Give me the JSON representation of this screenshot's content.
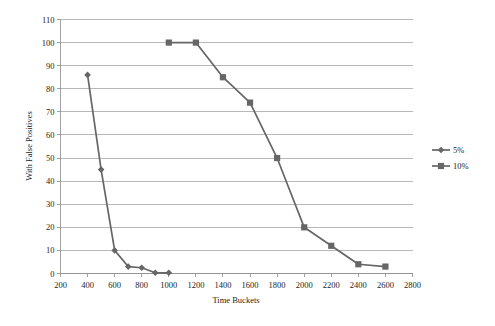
{
  "chart_data": {
    "type": "line",
    "title": "",
    "xlabel": "Time Buckets",
    "ylabel": "With False Positives",
    "xlim": [
      200,
      2800
    ],
    "ylim": [
      0,
      110
    ],
    "xticks": [
      200,
      400,
      600,
      800,
      1000,
      1200,
      1400,
      1600,
      1800,
      2000,
      2200,
      2400,
      2600,
      2800
    ],
    "yticks": [
      0,
      10,
      20,
      30,
      40,
      50,
      60,
      70,
      80,
      90,
      100,
      110
    ],
    "grid": "horizontal",
    "legend_position": "right",
    "series": [
      {
        "name": "5%",
        "marker": "diamond",
        "color": "#666666",
        "x": [
          400,
          500,
          600,
          700,
          800,
          900,
          1000
        ],
        "values": [
          86,
          45,
          10,
          3,
          2.5,
          0.3,
          0.3
        ]
      },
      {
        "name": "10%",
        "marker": "square",
        "color": "#666666",
        "x": [
          1000,
          1200,
          1400,
          1600,
          1800,
          2000,
          2200,
          2400,
          2600
        ],
        "values": [
          100,
          100,
          85,
          74,
          50,
          20,
          12,
          4,
          3
        ]
      }
    ]
  },
  "axis": {
    "x_title": "Time Buckets",
    "y_title": "With False Positives",
    "x_tick_labels": [
      "200",
      "400",
      "600",
      "800",
      "1000",
      "1200",
      "1400",
      "1600",
      "1800",
      "2000",
      "2200",
      "2400",
      "2600",
      "2800"
    ],
    "y_tick_labels": [
      "0",
      "10",
      "20",
      "30",
      "40",
      "50",
      "60",
      "70",
      "80",
      "90",
      "100",
      "110"
    ]
  },
  "legend": {
    "entries": [
      {
        "label": "5%",
        "marker": "diamond-icon"
      },
      {
        "label": "10%",
        "marker": "square-icon"
      }
    ]
  }
}
